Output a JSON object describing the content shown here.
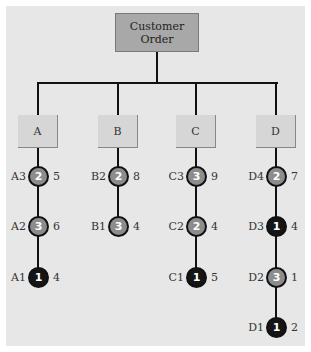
{
  "root": {
    "line1": "Customer",
    "line2": "Order",
    "fill": "#a8a8a8"
  },
  "components": [
    {
      "label": "A",
      "cx": 38,
      "nodes": [
        {
          "name": "A3",
          "level": "2",
          "qty": "5",
          "cy": 176,
          "color": "gray"
        },
        {
          "name": "A2",
          "level": "3",
          "qty": "6",
          "cy": 226,
          "color": "gray"
        },
        {
          "name": "A1",
          "level": "1",
          "qty": "4",
          "cy": 277,
          "color": "black"
        }
      ]
    },
    {
      "label": "B",
      "cx": 118,
      "nodes": [
        {
          "name": "B2",
          "level": "2",
          "qty": "8",
          "cy": 176,
          "color": "gray"
        },
        {
          "name": "B1",
          "level": "3",
          "qty": "4",
          "cy": 226,
          "color": "gray"
        }
      ]
    },
    {
      "label": "C",
      "cx": 196,
      "nodes": [
        {
          "name": "C3",
          "level": "3",
          "qty": "9",
          "cy": 176,
          "color": "gray"
        },
        {
          "name": "C2",
          "level": "2",
          "qty": "4",
          "cy": 226,
          "color": "gray"
        },
        {
          "name": "C1",
          "level": "1",
          "qty": "5",
          "cy": 277,
          "color": "black"
        }
      ]
    },
    {
      "label": "D",
      "cx": 276,
      "nodes": [
        {
          "name": "D4",
          "level": "2",
          "qty": "7",
          "cy": 176,
          "color": "gray"
        },
        {
          "name": "D3",
          "level": "1",
          "qty": "4",
          "cy": 226,
          "color": "black"
        },
        {
          "name": "D2",
          "level": "3",
          "qty": "1",
          "cy": 277,
          "color": "gray"
        },
        {
          "name": "D1",
          "level": "1",
          "qty": "2",
          "cy": 327,
          "color": "black"
        }
      ]
    }
  ],
  "colors": {
    "panel": "#e7e7e7",
    "line": "#111111",
    "node_gray": "#8c8c8c",
    "node_black": "#151515",
    "component_box": "#d6d6d6"
  }
}
